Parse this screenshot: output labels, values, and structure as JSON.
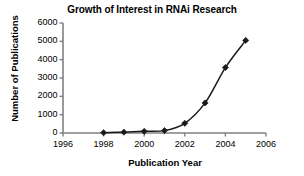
{
  "chart_data": {
    "type": "line",
    "title": "Growth of Interest in RNAi Research",
    "xlabel": "Publication Year",
    "ylabel": "Number of Publications",
    "x": [
      1998,
      1999,
      2000,
      2001,
      2002,
      2003,
      2004,
      2005
    ],
    "values": [
      20,
      45,
      90,
      130,
      530,
      1640,
      3570,
      5050
    ],
    "xlim": [
      1996,
      2006
    ],
    "ylim": [
      0,
      6000
    ],
    "xticks": [
      "1996",
      "1998",
      "2000",
      "2002",
      "2004",
      "2006"
    ],
    "xtick_values": [
      1996,
      1998,
      2000,
      2002,
      2004,
      2006
    ],
    "yticks": [
      "0",
      "1000",
      "2000",
      "3000",
      "4000",
      "5000",
      "6000"
    ],
    "ytick_values": [
      0,
      1000,
      2000,
      3000,
      4000,
      5000,
      6000
    ],
    "grid": false,
    "legend": false,
    "marker": "diamond",
    "line_color": "#1a1a1a",
    "marker_color": "#1a1a1a",
    "axis_color": "#808080",
    "background_color": "#ffffff"
  }
}
